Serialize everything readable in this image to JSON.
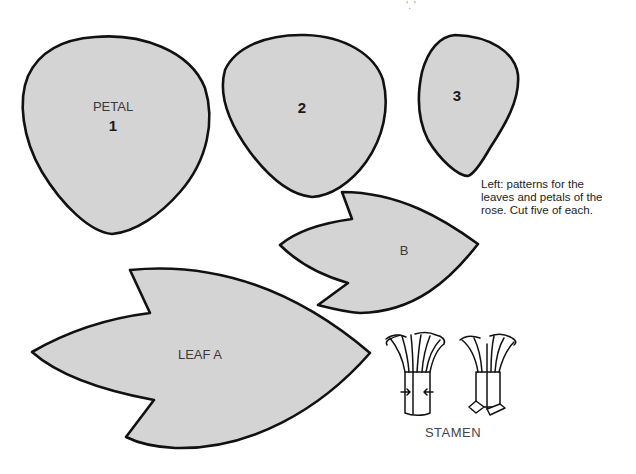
{
  "top_fragment": "ʻ. ʼ",
  "petals": [
    {
      "id": "petal-1",
      "name_label": "PETAL",
      "number": "1"
    },
    {
      "id": "petal-2",
      "number": "2"
    },
    {
      "id": "petal-3",
      "number": "3"
    }
  ],
  "leaves": [
    {
      "id": "leaf-b",
      "label": "B"
    },
    {
      "id": "leaf-a",
      "label": "LEAF  A"
    }
  ],
  "stamen": {
    "label": "STAMEN"
  },
  "caption": {
    "lines": [
      "Left: patterns for the",
      "leaves and petals of the",
      "rose. Cut five of each."
    ]
  },
  "colors": {
    "shape_fill": "#d4d4d4",
    "outline": "#111111",
    "background": "#ffffff"
  }
}
